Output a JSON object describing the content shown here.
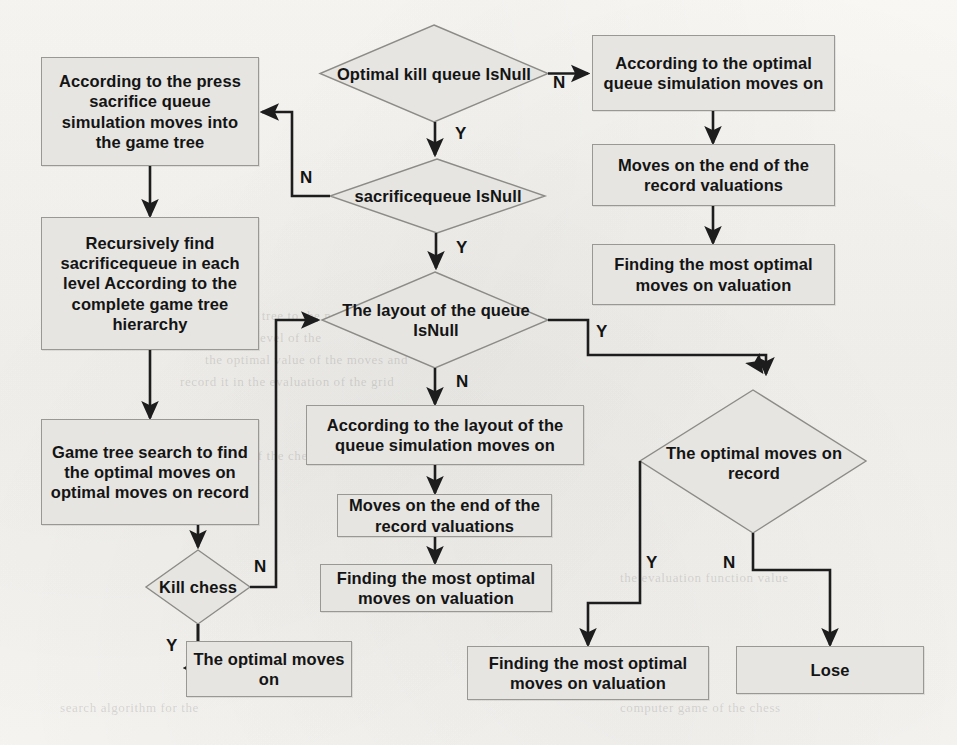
{
  "diagram": {
    "colors": {
      "node_fill": "#e6e5e2",
      "node_border": "#9a9894",
      "wire": "#1d1d1d",
      "page_background": "#f7f6f3",
      "text": "#141414"
    }
  },
  "nodes": {
    "press_sacrifice_box": "According to the press sacrifice queue simulation moves into the game tree",
    "recursive_find_box": "Recursively find sacrificequeue in each level According to the complete game tree hierarchy",
    "game_tree_search_box": "Game tree search to find the optimal moves on optimal moves on record",
    "kill_chess_diamond": "Kill chess",
    "optimal_moves_on_box": "The optimal moves on",
    "optimal_kill_queue_diamond": "Optimal kill queue IsNull",
    "sacrificequeue_diamond": "sacrificequeue IsNull",
    "layout_queue_diamond": "The layout of the queue  IsNull",
    "layout_sim_box": "According to the layout of the queue simulation moves on",
    "moves_end_record_mid_box": "Moves on the end of the record valuations",
    "finding_optimal_mid_box": "Finding the most optimal moves on valuation",
    "optimal_queue_sim_box": "According to the optimal queue simulation moves on",
    "moves_end_record_right_box": "Moves on the end of the record valuations",
    "finding_optimal_right_box": "Finding the most optimal moves on valuation",
    "optimal_moves_record_diamond": "The optimal moves on record",
    "finding_optimal_bottom_box": "Finding the most optimal moves on valuation",
    "lose_box": "Lose"
  },
  "edge_labels": {
    "optimal_kill_queue_no": "N",
    "optimal_kill_queue_yes": "Y",
    "sacrificequeue_no": "N",
    "sacrificequeue_yes": "Y",
    "layout_queue_yes": "Y",
    "layout_queue_no": "N",
    "kill_chess_no": "N",
    "kill_chess_yes": "Y",
    "optimal_record_yes": "Y",
    "optimal_record_no": "N"
  },
  "background_ghost_text": [
    "of the game tree to the node for the",
    "search in each level of the",
    "the optimal value of the moves and",
    "record it in the evaluation of the grid",
    "the situation of the chessboard",
    "the evaluation function value",
    "search algorithm for the",
    "computer game of the chess"
  ]
}
